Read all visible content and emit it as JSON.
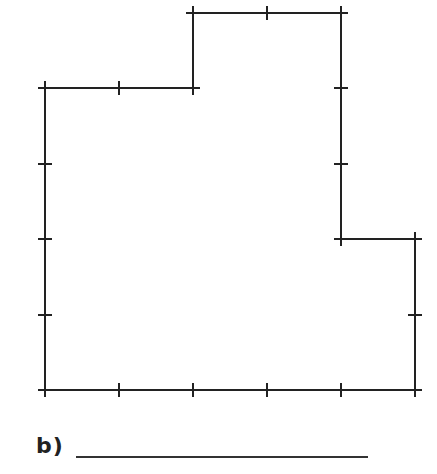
{
  "diagram": {
    "type": "rectilinear-shape-on-grid",
    "stroke_color": "#222222",
    "grid_unit_px": 74,
    "grid_origin": [
      45,
      13
    ],
    "vertices_grid": [
      [
        0,
        1
      ],
      [
        2,
        1
      ],
      [
        2,
        0
      ],
      [
        4,
        0
      ],
      [
        4,
        3
      ],
      [
        5,
        3
      ],
      [
        5,
        5
      ],
      [
        0,
        5
      ]
    ],
    "tick_marks": "at every grid unit along each edge"
  },
  "question": {
    "label": "b)",
    "answer_value": ""
  }
}
